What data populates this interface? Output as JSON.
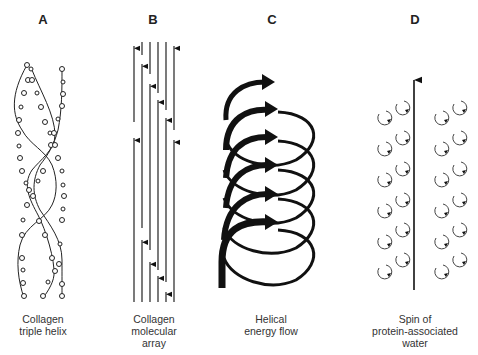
{
  "figure": {
    "panels": [
      {
        "letter": "A",
        "caption_lines": [
          "Collagen",
          "triple helix"
        ]
      },
      {
        "letter": "B",
        "caption_lines": [
          "Collagen",
          "molecular",
          "array"
        ]
      },
      {
        "letter": "C",
        "caption_lines": [
          "Helical",
          "energy flow"
        ]
      },
      {
        "letter": "D",
        "caption_lines": [
          "Spin of",
          "protein-associated",
          "water"
        ]
      }
    ],
    "colors": {
      "ink": "#111111",
      "text": "#333333",
      "background": "#ffffff"
    }
  }
}
